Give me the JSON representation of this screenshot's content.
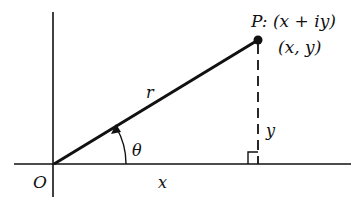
{
  "diagram": {
    "colors": {
      "ink": "#111111",
      "background": "#ffffff"
    },
    "origin_label": "O",
    "point_label": "P: (x + iy)",
    "point_coords_label": "(x, y)",
    "radius_label": "r",
    "angle_label": "θ",
    "x_label": "x",
    "y_label": "y"
  }
}
